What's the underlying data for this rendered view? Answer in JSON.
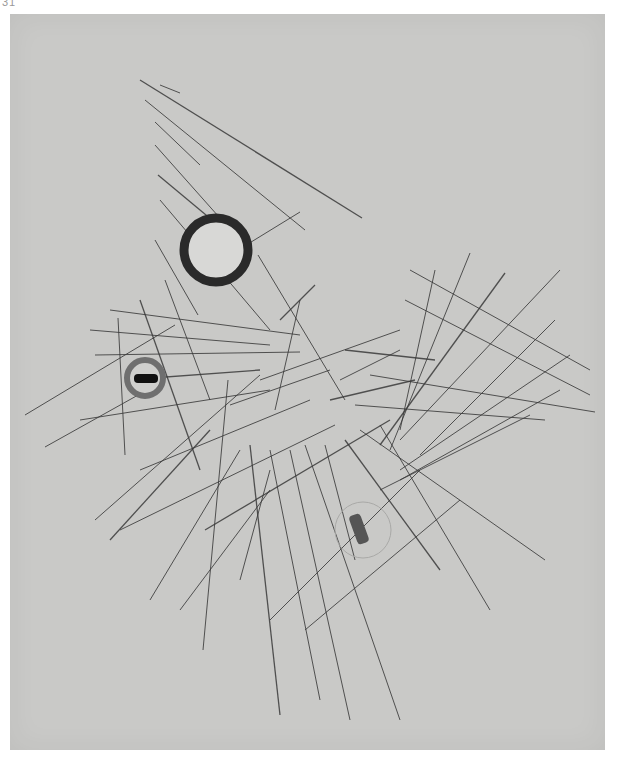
{
  "page": {
    "number": "31"
  },
  "artwork": {
    "paper_color": "#c9c9c7",
    "line_color": "#3a3a3a",
    "circles": [
      {
        "name": "large-dark-ring",
        "cx": 216,
        "cy": 250,
        "r": 32,
        "stroke": "#2a2a2a",
        "stroke_width": 9,
        "fill": "#d8d8d6"
      },
      {
        "name": "small-gray-ring",
        "cx": 145,
        "cy": 378,
        "r": 18,
        "stroke": "#6f6f6f",
        "stroke_width": 6,
        "fill": "#cfcfcd"
      },
      {
        "name": "faint-ring",
        "cx": 363,
        "cy": 530,
        "r": 28,
        "stroke": "#a9a9a7",
        "stroke_width": 1,
        "fill": "none"
      }
    ],
    "bars": [
      {
        "name": "black-bar",
        "x": 134,
        "y": 374,
        "w": 24,
        "h": 9,
        "rx": 4,
        "fill": "#111",
        "rotate": 0
      },
      {
        "name": "gray-capsule",
        "x": 353,
        "y": 514,
        "w": 12,
        "h": 30,
        "rx": 4,
        "fill": "#555",
        "rotate": -20
      }
    ],
    "lines": [
      [
        140,
        80,
        362,
        218
      ],
      [
        160,
        85,
        180,
        93
      ],
      [
        145,
        100,
        305,
        230
      ],
      [
        155,
        122,
        200,
        165
      ],
      [
        155,
        145,
        235,
        235
      ],
      [
        158,
        175,
        230,
        235
      ],
      [
        160,
        200,
        270,
        330
      ],
      [
        155,
        240,
        198,
        315
      ],
      [
        230,
        255,
        300,
        212
      ],
      [
        258,
        255,
        345,
        400
      ],
      [
        280,
        320,
        315,
        285
      ],
      [
        300,
        300,
        275,
        410
      ],
      [
        110,
        310,
        300,
        335
      ],
      [
        90,
        330,
        270,
        345
      ],
      [
        95,
        355,
        300,
        352
      ],
      [
        125,
        380,
        260,
        370
      ],
      [
        80,
        420,
        270,
        390
      ],
      [
        25,
        415,
        175,
        325
      ],
      [
        45,
        447,
        165,
        380
      ],
      [
        118,
        318,
        125,
        455
      ],
      [
        140,
        300,
        200,
        470
      ],
      [
        165,
        280,
        210,
        400
      ],
      [
        140,
        470,
        310,
        400
      ],
      [
        120,
        530,
        335,
        425
      ],
      [
        95,
        520,
        260,
        375
      ],
      [
        110,
        540,
        210,
        430
      ],
      [
        180,
        610,
        270,
        490
      ],
      [
        150,
        600,
        240,
        450
      ],
      [
        270,
        470,
        240,
        580
      ],
      [
        228,
        380,
        203,
        650
      ],
      [
        250,
        445,
        280,
        715
      ],
      [
        270,
        450,
        320,
        700
      ],
      [
        290,
        450,
        350,
        720
      ],
      [
        305,
        445,
        400,
        720
      ],
      [
        325,
        445,
        355,
        560
      ],
      [
        345,
        440,
        440,
        570
      ],
      [
        360,
        430,
        545,
        560
      ],
      [
        380,
        425,
        490,
        610
      ],
      [
        270,
        620,
        420,
        470
      ],
      [
        305,
        630,
        460,
        500
      ],
      [
        205,
        530,
        390,
        420
      ],
      [
        260,
        380,
        400,
        330
      ],
      [
        230,
        405,
        330,
        370
      ],
      [
        410,
        270,
        590,
        370
      ],
      [
        405,
        300,
        590,
        395
      ],
      [
        345,
        350,
        435,
        360
      ],
      [
        370,
        375,
        595,
        412
      ],
      [
        355,
        405,
        545,
        420
      ],
      [
        435,
        270,
        400,
        430
      ],
      [
        470,
        253,
        390,
        450
      ],
      [
        505,
        273,
        380,
        445
      ],
      [
        560,
        270,
        400,
        440
      ],
      [
        555,
        320,
        420,
        455
      ],
      [
        570,
        355,
        400,
        470
      ],
      [
        340,
        380,
        400,
        350
      ],
      [
        330,
        400,
        415,
        380
      ],
      [
        380,
        490,
        530,
        415
      ],
      [
        400,
        480,
        560,
        390
      ]
    ]
  }
}
